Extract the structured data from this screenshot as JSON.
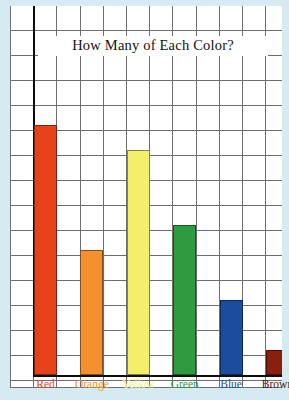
{
  "chart_data": {
    "type": "bar",
    "title": "How Many of Each Color?",
    "xlabel": "",
    "ylabel": "",
    "categories": [
      "Red",
      "Orange",
      "Yellow",
      "Green",
      "Blue",
      "Brown"
    ],
    "values": [
      10,
      5,
      9,
      6,
      3,
      1
    ],
    "ylim": [
      0,
      15
    ],
    "grid": true,
    "legend": "none",
    "bar_colors": [
      "#e8421a",
      "#f4902e",
      "#f2f06a",
      "#2f9b40",
      "#1b4c9e",
      "#8a1f10"
    ],
    "label_colors": [
      "#e8421a",
      "#f4902e",
      "#f0ee7a",
      "#2f9b40",
      "#1b4c9e",
      "#4a1208"
    ],
    "series": [
      {
        "name": "Count",
        "values": [
          10,
          5,
          9,
          6,
          3,
          1
        ]
      }
    ]
  },
  "page": {
    "paper_color": "#ffffff",
    "background_color": "#d6ebf1",
    "grid_line_color": "#6e6e6e",
    "axis_color": "#0d0d0d"
  },
  "labels": {
    "red": "Red",
    "orange": "Orange",
    "yellow": "Yellow",
    "green": "Green",
    "blue": "Blue",
    "brown": "Brown"
  }
}
